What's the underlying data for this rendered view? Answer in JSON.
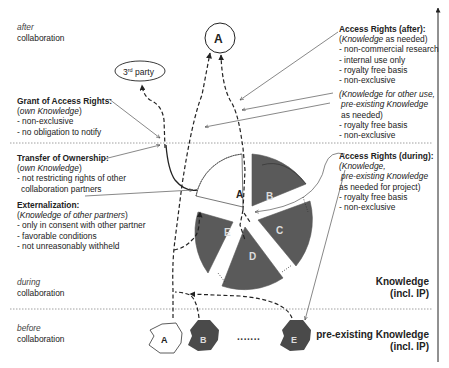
{
  "phases": {
    "after": {
      "italic": "after",
      "text": "collaboration"
    },
    "during": {
      "italic": "during",
      "text": "collaboration"
    },
    "before": {
      "italic": "before",
      "text": "collaboration"
    }
  },
  "levels": {
    "knowledge": {
      "line1": "Knowledge",
      "line2": "(incl. IP)"
    },
    "pre_existing": {
      "line1": "pre-existing Knowledge",
      "line2": "(incl. IP)"
    }
  },
  "nodes": {
    "after_partner": "A",
    "third_party": "3rd party",
    "third_party_base": "3",
    "third_party_sup": "rd",
    "third_party_rest": " party",
    "pie_segments": [
      "A",
      "B",
      "C",
      "D",
      "E"
    ],
    "pre_existing": [
      "A",
      "B",
      "E"
    ],
    "ellipsis": "·······"
  },
  "colors": {
    "segment_fill": "#5a5a5a",
    "own_segment_fill": "#ffffff",
    "line": "#222222",
    "separator": "#888888"
  },
  "annotations": {
    "grant": {
      "title": "Grant of Access Rights:",
      "subtitle_open": "(",
      "subtitle_italic": "own Knowledge",
      "subtitle_close": ")",
      "items": [
        "- non-exclusive",
        "- no obligation to notify"
      ]
    },
    "transfer": {
      "title": "Transfer of Ownership:",
      "subtitle_open": "(",
      "subtitle_italic": "own Knowledge",
      "subtitle_close": ")",
      "items": [
        "- not restricting rights of other",
        "  collaboration partners"
      ]
    },
    "externalization": {
      "title": "Externalization:",
      "subtitle_open": "(",
      "subtitle_italic": "Knowledge of other partners",
      "subtitle_close": ")",
      "items": [
        "- only in consent with other partner",
        "- favorable conditions",
        "- not unreasonably withheld"
      ]
    },
    "access_after": {
      "title": "Access Rights (after):",
      "subtitle_open": "(",
      "subtitle_italic": "Knowledge",
      "subtitle_rest": " as needed)",
      "items": [
        "- non-commercial research",
        "- internal use only",
        "- royalty free basis",
        "- non-exclusive"
      ],
      "sub2_line1_italic": "(Knowledge for other use,",
      "sub2_line2_italic": "pre-existing Knowledge",
      "sub2_line3": "as needed)",
      "items2": [
        "- royalty free basis",
        "- non-exclusive"
      ]
    },
    "access_during": {
      "title": "Access Rights (during):",
      "line1_italic": "(Knowledge,",
      "line2_italic": "pre-existing Knowledge",
      "line3": "as needed for project)",
      "items": [
        "- royalty free basis",
        "- non-exclusive"
      ]
    }
  }
}
